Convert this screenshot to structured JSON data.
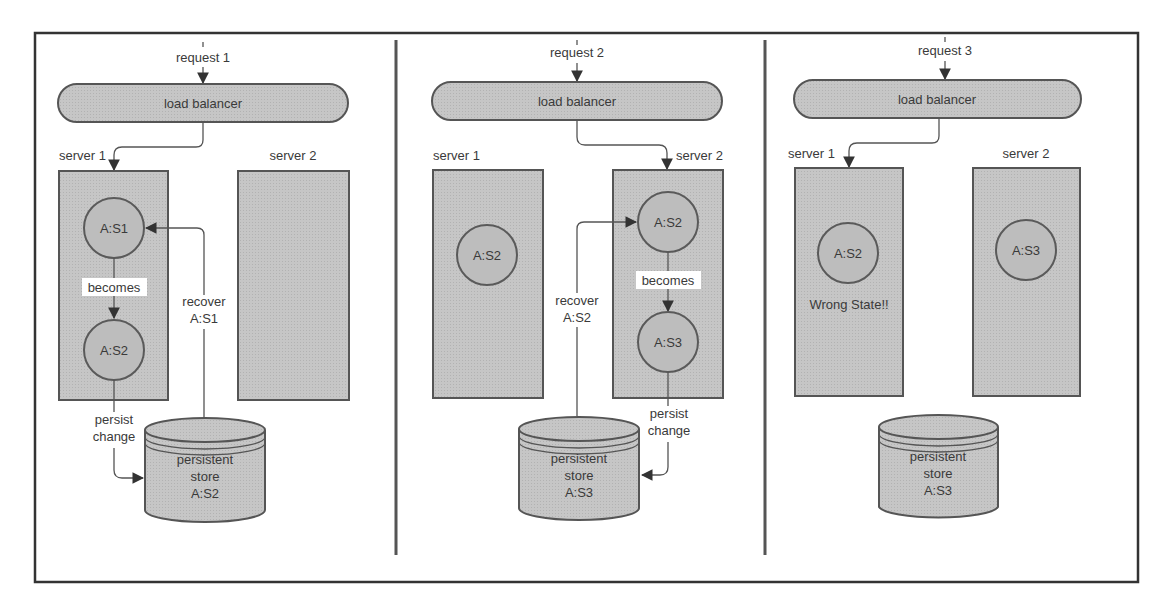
{
  "colors": {
    "background": "#ffffff",
    "shape_fill": "#c4c4c4",
    "stroke": "#555555",
    "text": "#3a3a3a"
  },
  "panels": [
    {
      "request": "request 1",
      "load_balancer": "load balancer",
      "servers": [
        {
          "label": "server 1",
          "states": [
            "A:S1",
            "A:S2"
          ],
          "transition": "becomes"
        },
        {
          "label": "server 2",
          "states": []
        }
      ],
      "recover_label": [
        "recover",
        "A:S1"
      ],
      "persist_label": [
        "persist",
        "change"
      ],
      "store": [
        "persistent",
        "store",
        "A:S2"
      ]
    },
    {
      "request": "request 2",
      "load_balancer": "load balancer",
      "servers": [
        {
          "label": "server 1",
          "states": [
            "A:S2"
          ]
        },
        {
          "label": "server 2",
          "states": [
            "A:S2",
            "A:S3"
          ],
          "transition": "becomes"
        }
      ],
      "recover_label": [
        "recover",
        "A:S2"
      ],
      "persist_label": [
        "persist",
        "change"
      ],
      "store": [
        "persistent",
        "store",
        "A:S3"
      ]
    },
    {
      "request": "request 3",
      "load_balancer": "load balancer",
      "servers": [
        {
          "label": "server 1",
          "states": [
            "A:S2"
          ],
          "note": "Wrong State!!"
        },
        {
          "label": "server 2",
          "states": [
            "A:S3"
          ]
        }
      ],
      "store": [
        "persistent",
        "store",
        "A:S3"
      ]
    }
  ]
}
